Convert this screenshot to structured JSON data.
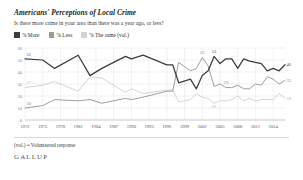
{
  "header": {
    "title": "Americans' Perceptions of Local Crime",
    "subtitle": "Is there more crime in your area than there was a year ago, or less?"
  },
  "legend": {
    "position": "top-left",
    "items": [
      {
        "label": "% More",
        "color": "#3d3d3d",
        "icon": "legend-swatch-more"
      },
      {
        "label": "% Less",
        "color": "#9a9a9a",
        "icon": "legend-swatch-less"
      },
      {
        "label": "% The same (vol.)",
        "color": "#d2d2d2",
        "icon": "legend-swatch-same"
      }
    ]
  },
  "footer": {
    "note": "(vol.) = Volunteered response",
    "brand": "GALLUP"
  },
  "chart_data": {
    "type": "line",
    "title": "Americans' Perceptions of Local Crime",
    "subtitle": "Is there more crime in your area than there was a year ago, or less?",
    "xlabel": "",
    "ylabel": "",
    "ylim": [
      0,
      60
    ],
    "yticks": [
      0,
      10,
      20,
      30,
      40,
      50,
      60
    ],
    "ytick_labels": [
      "0",
      "10",
      "20",
      "30",
      "40",
      "50",
      "60"
    ],
    "grid": true,
    "xtick_labels": [
      "1972",
      "1975",
      "1978",
      "1981",
      "1984",
      "1987",
      "1990",
      "1993",
      "1996",
      "1999",
      "2002",
      "2005",
      "2008",
      "2011",
      "2014"
    ],
    "xticks": [
      1972,
      1975,
      1978,
      1981,
      1984,
      1987,
      1990,
      1993,
      1996,
      1999,
      2002,
      2005,
      2008,
      2011,
      2014
    ],
    "xlim": [
      1972,
      2016
    ],
    "x": [
      1972,
      1975,
      1977,
      1981,
      1983,
      1985,
      1989,
      1990,
      1992,
      1996,
      1997,
      1998,
      2000,
      2001,
      2002,
      2003,
      2004,
      2005,
      2006,
      2007,
      2008,
      2009,
      2010,
      2011,
      2012,
      2013,
      2014,
      2015,
      2016
    ],
    "series": [
      {
        "name": "% More",
        "color": "#3d3d3d",
        "values": [
          51,
          50,
          43,
          54,
          37,
          43,
          53,
          51,
          54,
          46,
          46,
          31,
          34,
          26,
          37,
          41,
          53,
          47,
          51,
          51,
          43,
          51,
          49,
          48,
          47,
          41,
          43,
          41,
          46
        ],
        "point_labels": [
          {
            "x": 1972,
            "value": 51
          },
          {
            "x": 2004,
            "value": 53
          },
          {
            "x": 2016,
            "value": 46
          }
        ]
      },
      {
        "name": "% Less",
        "color": "#9a9a9a",
        "values": [
          10,
          12,
          17,
          16,
          17,
          14,
          18,
          17,
          19,
          24,
          24,
          48,
          41,
          43,
          52,
          45,
          28,
          30,
          27,
          27,
          29,
          26,
          26,
          30,
          29,
          36,
          34,
          30,
          33
        ],
        "point_labels": [
          {
            "x": 1972,
            "value": 10
          },
          {
            "x": 2002,
            "value": 52
          },
          {
            "x": 2006,
            "value": 29
          },
          {
            "x": 2016,
            "value": 33
          }
        ]
      },
      {
        "name": "% The same (vol.)",
        "color": "#d2d2d2",
        "values": [
          27,
          29,
          32,
          24,
          36,
          35,
          23,
          26,
          22,
          25,
          25,
          15,
          17,
          22,
          19,
          18,
          14,
          16,
          16,
          17,
          20,
          16,
          18,
          16,
          17,
          17,
          17,
          22,
          18
        ],
        "point_labels": [
          {
            "x": 1972,
            "value": 27
          },
          {
            "x": 2004,
            "value": 16
          },
          {
            "x": 2016,
            "value": 18
          }
        ]
      }
    ]
  }
}
